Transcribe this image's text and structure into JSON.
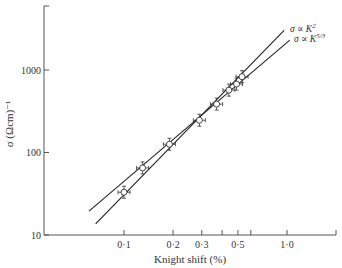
{
  "chart_data": {
    "type": "line",
    "title": "",
    "xlabel": "Knight shift (%)",
    "ylabel": "σ (Ωcm)⁻¹",
    "x_scale": "log",
    "y_scale": "log",
    "xlim": [
      0.045,
      1.9
    ],
    "ylim": [
      10,
      6000
    ],
    "grid": false,
    "x_ticks": [
      0.1,
      0.2,
      0.3,
      0.4,
      0.5,
      0.6,
      1.0,
      1.9
    ],
    "x_tick_labels": [
      {
        "value": 0.1,
        "label": "0·1"
      },
      {
        "value": 0.2,
        "label": "0·2"
      },
      {
        "value": 0.3,
        "label": "0·3"
      },
      {
        "value": 0.5,
        "label": "0·5"
      },
      {
        "value": 1.0,
        "label": "1·0"
      }
    ],
    "y_ticks": [
      10,
      100,
      1000,
      6000
    ],
    "y_tick_labels": [
      {
        "value": 10,
        "label": "10"
      },
      {
        "value": 100,
        "label": "100"
      },
      {
        "value": 1000,
        "label": "1000"
      }
    ],
    "series": [
      {
        "name": "data",
        "kind": "scatter-with-errorbars",
        "marker": "open-circle",
        "points": [
          {
            "x": 0.1,
            "y": 33
          },
          {
            "x": 0.13,
            "y": 65
          },
          {
            "x": 0.19,
            "y": 126
          },
          {
            "x": 0.29,
            "y": 246
          },
          {
            "x": 0.37,
            "y": 386
          },
          {
            "x": 0.44,
            "y": 570
          },
          {
            "x": 0.49,
            "y": 675
          },
          {
            "x": 0.53,
            "y": 830
          }
        ]
      },
      {
        "name": "σ ∝ K²",
        "kind": "line",
        "points": [
          {
            "x": 0.067,
            "y": 13.6
          },
          {
            "x": 0.96,
            "y": 3030
          }
        ]
      },
      {
        "name": "σ ∝ K^{5/3}",
        "kind": "line",
        "points": [
          {
            "x": 0.061,
            "y": 19.5
          },
          {
            "x": 1.04,
            "y": 2300
          }
        ]
      }
    ],
    "legend": [
      {
        "label_main": "σ ∝ K",
        "sup": "2"
      },
      {
        "label_main": "σ ∝ K",
        "sup": "5/3"
      }
    ],
    "legend_position": "inline-at-line-ends-top-right"
  }
}
